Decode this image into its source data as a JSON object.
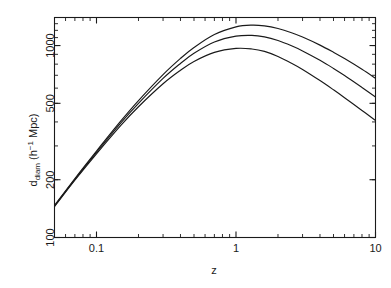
{
  "figure": {
    "background_color": "#ffffff",
    "line_color": "#1a1a1a",
    "text_color": "#1a1a1a"
  },
  "chart_data": {
    "type": "line",
    "title": "",
    "xlabel": "z",
    "ylabel": "d_diam  (h^-1 Mpc)",
    "ylabel_main": "d",
    "ylabel_sub": "diam",
    "ylabel_units_pre": "(h",
    "ylabel_units_sup": "−1",
    "ylabel_units_post": " Mpc)",
    "xscale": "log",
    "yscale": "log",
    "xlim": [
      0.05,
      10
    ],
    "ylim": [
      100,
      1400
    ],
    "grid": false,
    "legend": "none",
    "xticks": [
      0.1,
      1,
      10
    ],
    "xticklabels": [
      "0.1",
      "1",
      "10"
    ],
    "yticks": [
      100,
      200,
      500,
      1000
    ],
    "yticklabels": [
      "100",
      "200",
      "500",
      "1000"
    ],
    "xminorticks": [
      0.05,
      0.06,
      0.07,
      0.08,
      0.09,
      0.2,
      0.3,
      0.4,
      0.5,
      0.6,
      0.7,
      0.8,
      0.9,
      2,
      3,
      4,
      5,
      6,
      7,
      8,
      9
    ],
    "yminorticks": [
      200,
      300,
      400,
      500,
      600,
      700,
      800,
      900,
      1000,
      1100,
      1200,
      1300
    ],
    "series": [
      {
        "name": "curve-upper",
        "x": [
          0.05,
          0.07,
          0.1,
          0.15,
          0.2,
          0.3,
          0.4,
          0.5,
          0.7,
          1.0,
          1.3,
          1.6,
          2.0,
          2.5,
          3.0,
          4.0,
          5.0,
          6.0,
          8.0,
          10.0
        ],
        "values": [
          147,
          203,
          282,
          406,
          517,
          706,
          857,
          977,
          1142,
          1251,
          1278,
          1266,
          1226,
          1166,
          1107,
          1005,
          922,
          855,
          752,
          675
        ]
      },
      {
        "name": "curve-middle",
        "x": [
          0.05,
          0.07,
          0.1,
          0.15,
          0.2,
          0.3,
          0.4,
          0.5,
          0.7,
          1.0,
          1.3,
          1.6,
          2.0,
          2.5,
          3.0,
          4.0,
          5.0,
          6.0,
          8.0,
          10.0
        ],
        "values": [
          146,
          201,
          278,
          397,
          500,
          674,
          807,
          911,
          1043,
          1119,
          1130,
          1110,
          1062,
          997,
          938,
          838,
          760,
          698,
          605,
          540
        ]
      },
      {
        "name": "curve-lower",
        "x": [
          0.05,
          0.07,
          0.1,
          0.15,
          0.2,
          0.3,
          0.4,
          0.5,
          0.7,
          1.0,
          1.3,
          1.6,
          2.0,
          2.5,
          3.0,
          4.0,
          5.0,
          6.0,
          8.0,
          10.0
        ],
        "values": [
          145,
          199,
          273,
          385,
          480,
          632,
          743,
          826,
          921,
          966,
          960,
          932,
          877,
          809,
          751,
          657,
          588,
          535,
          459,
          407
        ]
      }
    ]
  }
}
